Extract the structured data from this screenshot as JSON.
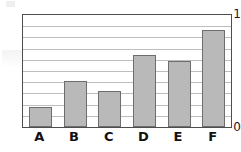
{
  "chart_data": {
    "type": "bar",
    "title": "",
    "xlabel": "",
    "ylabel": "",
    "categories": [
      "A",
      "B",
      "C",
      "D",
      "E",
      "F"
    ],
    "values": [
      0.18,
      0.41,
      0.32,
      0.64,
      0.59,
      0.87
    ],
    "ylim": [
      0,
      1
    ],
    "y_tick_labels": [
      "0",
      "1"
    ],
    "y_tick_values": [
      0,
      1
    ],
    "gridlines": {
      "visible": true,
      "orientation": "horizontal",
      "count": 9,
      "interval": 0.1,
      "values": [
        0.1,
        0.2,
        0.3,
        0.4,
        0.5,
        0.6,
        0.7,
        0.8,
        0.9
      ]
    },
    "legend": {
      "visible": false,
      "entries": []
    },
    "colors": {
      "bar_fill": "#b9b9b9",
      "bar_border": "#6e6e6e",
      "gridline": "#bdbdbd",
      "axis": "#4d4d4d",
      "text": "#111111",
      "background": "#ffffff"
    }
  },
  "axis": {
    "y_top_label": "1",
    "y_bottom_label": "0"
  }
}
